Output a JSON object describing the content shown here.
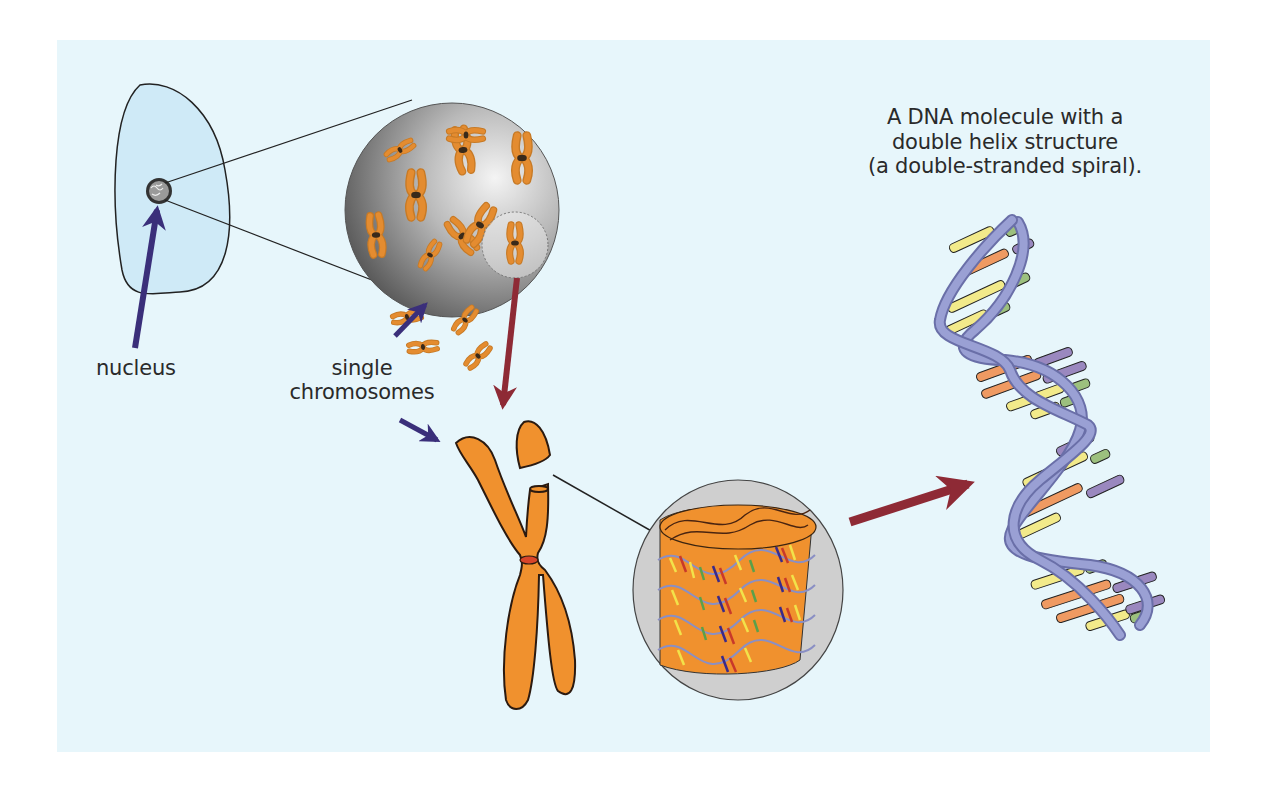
{
  "figure": {
    "labels": {
      "nucleus": "nucleus",
      "single_chromosomes_line1": "single",
      "single_chromosomes_line2": "chromosomes",
      "dna_line1": "A DNA molecule with a",
      "dna_line2": "double helix structure",
      "dna_line3": "(a double-stranded spiral)."
    },
    "stages": [
      {
        "id": "cell",
        "description": "Cell outline with nucleus"
      },
      {
        "id": "nucleus-magnified",
        "description": "Magnified nucleus containing single chromosomes"
      },
      {
        "id": "chromosome",
        "description": "Single X-shaped chromosome with centromere"
      },
      {
        "id": "chromatin",
        "description": "Chromatin fibre of coiled DNA around proteins"
      },
      {
        "id": "dna-helix",
        "description": "DNA double helix with coloured base pairs"
      }
    ],
    "colors": {
      "background": "#e7f6fb",
      "cell_fill": "#cfeaf7",
      "chromosome": "#f0912e",
      "chromosome_outline": "#2b1a10",
      "centromere": "#d8452a",
      "blue_arrow": "#3a2f7a",
      "red_arrow": "#8e2a35",
      "helix_backbone": "#8a8fc4",
      "base_yellow": "#f2ea8a",
      "base_orange": "#ef9a62",
      "base_green": "#9cc07e",
      "base_purple": "#9a88bf"
    }
  }
}
